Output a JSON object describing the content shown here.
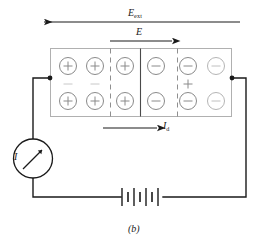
{
  "figure": {
    "caption": "(b)",
    "colors": {
      "ink": "#1a1a1a",
      "box_outline": "#b8b8b8",
      "charge_circle": "#8a8a8a",
      "faint_sign": "#c4c4c4",
      "background": "#ffffff"
    }
  },
  "labels": {
    "e_ext": {
      "symbol": "E",
      "subscript": "ext",
      "text": "E_ext"
    },
    "e_field": {
      "symbol": "E",
      "subscript": "",
      "text": "E"
    },
    "i_d": {
      "symbol": "I",
      "subscript": "d",
      "text": "I_d"
    },
    "i_current": {
      "symbol": "I",
      "subscript": "",
      "text": "I"
    }
  },
  "arrows": [
    {
      "name": "e-ext-arrow",
      "direction": "left",
      "label": "E_ext"
    },
    {
      "name": "e-arrow",
      "direction": "right",
      "label": "E"
    },
    {
      "name": "id-arrow",
      "direction": "right",
      "label": "I_d"
    }
  ],
  "slab": {
    "columns": [
      {
        "index": 1,
        "charge": "+",
        "between_rows_sign": "−"
      },
      {
        "index": 2,
        "charge": "+",
        "between_rows_sign": "−"
      },
      {
        "index": 3,
        "charge": "+",
        "between_rows_sign": ""
      },
      {
        "index": 4,
        "charge": "−",
        "between_rows_sign": ""
      },
      {
        "index": 5,
        "charge": "−",
        "between_rows_sign": "+"
      },
      {
        "index": 6,
        "charge": "−",
        "between_rows_sign": ""
      }
    ],
    "rows": 2,
    "dividers": [
      {
        "style": "dashed",
        "after_column": 2
      },
      {
        "style": "solid",
        "after_column": 3
      },
      {
        "style": "dashed",
        "after_column": 4
      }
    ]
  },
  "components": {
    "ammeter": {
      "name": "ammeter",
      "label": "I",
      "symbol": "circle-with-needle"
    },
    "battery": {
      "name": "battery",
      "symbol": "battery-cells",
      "plate_count": 7
    }
  }
}
